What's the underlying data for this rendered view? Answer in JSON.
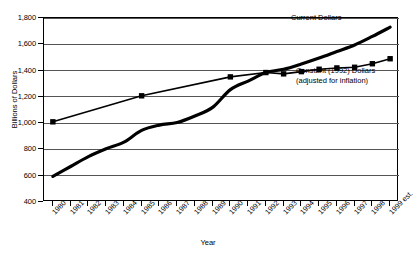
{
  "chart_data": {
    "type": "line",
    "title": "",
    "xlabel": "Year",
    "ylabel": "Billions of Dollars",
    "ylim": [
      400,
      1800
    ],
    "ytick_step": 200,
    "yticks": [
      "400",
      "600",
      "800",
      "1,000",
      "1,200",
      "1,400",
      "1,600",
      "1,800"
    ],
    "grid": true,
    "legend_position": "inline-annotation",
    "categories": [
      "1980",
      "1981",
      "1982",
      "1983",
      "1984",
      "1985",
      "1986",
      "1987",
      "1988",
      "1989",
      "1990",
      "1991",
      "1992",
      "1993",
      "1994",
      "1995",
      "1996",
      "1997",
      "1998",
      "1999 est."
    ],
    "series": [
      {
        "name": "Current Dollars",
        "marker": "none",
        "color": "#000000",
        "x": [
          "1980",
          "1981",
          "1982",
          "1983",
          "1984",
          "1985",
          "1986",
          "1987",
          "1988",
          "1989",
          "1990",
          "1991",
          "1992",
          "1993",
          "1994",
          "1995",
          "1996",
          "1997",
          "1998",
          "1999 est."
        ],
        "values": [
          595,
          670,
          745,
          805,
          855,
          945,
          985,
          1005,
          1055,
          1120,
          1255,
          1320,
          1385,
          1410,
          1450,
          1495,
          1545,
          1595,
          1660,
          1730
        ]
      },
      {
        "name": "Constant (1992) Dollars",
        "sublabel": "(adjusted for inflation)",
        "marker": "square",
        "color": "#000000",
        "x": [
          "1980",
          "1985",
          "1990",
          "1992",
          "1993",
          "1994",
          "1995",
          "1996",
          "1997",
          "1998",
          "1999 est."
        ],
        "values": [
          1010,
          1208,
          1352,
          1385,
          1375,
          1392,
          1410,
          1420,
          1425,
          1452,
          1490
        ]
      }
    ],
    "annotations": [
      {
        "text": "Current Dollars"
      },
      {
        "text": "Constant (1992) Dollars"
      },
      {
        "text": "(adjusted for inflation)"
      }
    ]
  }
}
